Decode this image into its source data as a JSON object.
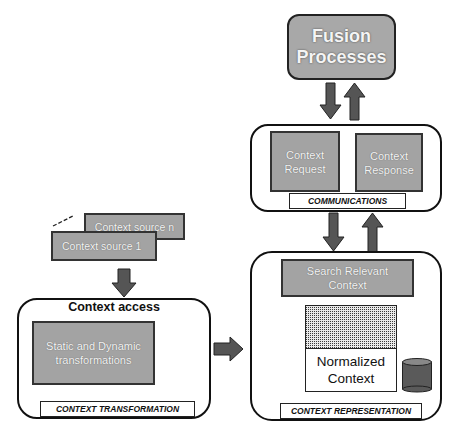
{
  "diagram": {
    "fusion": {
      "label": "Fusion Processes"
    },
    "communications": {
      "label": "COMMUNICATIONS",
      "request": "Context Request",
      "response": "Context Response"
    },
    "representation": {
      "label": "CONTEXT REPRESENTATION",
      "search": "Search Relevant Context",
      "normalized": "Normalized Context"
    },
    "sources": {
      "source_n": "Context source n",
      "source_1": "Context source 1"
    },
    "transformation": {
      "title": "Context access",
      "inner": "Static and Dynamic transformations",
      "label": "CONTEXT TRANSFORMATION"
    }
  },
  "colors": {
    "box_fill": "#a3a3a3",
    "arrow_fill": "#555555",
    "border": "#222222"
  }
}
